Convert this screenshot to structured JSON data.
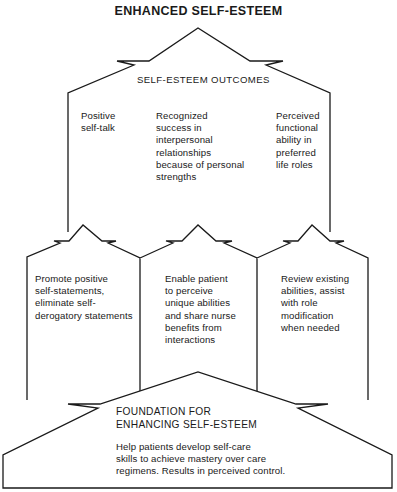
{
  "title": "ENHANCED SELF-ESTEEM",
  "outcomes": {
    "heading": "SELF-ESTEEM OUTCOMES",
    "items": [
      {
        "lines": [
          "Positive",
          "self-talk"
        ]
      },
      {
        "lines": [
          "Recognized",
          "success in",
          "interpersonal",
          "relationships",
          "because of personal",
          "strengths"
        ]
      },
      {
        "lines": [
          "Perceived",
          "functional",
          "ability in",
          "preferred",
          "life roles"
        ]
      }
    ]
  },
  "interventions": [
    {
      "lines": [
        "Promote positive",
        "self-statements,",
        "eliminate self-",
        "derogatory statements"
      ]
    },
    {
      "lines": [
        "Enable patient",
        "to perceive",
        "unique abilities",
        "and share nurse",
        "benefits from",
        "interactions"
      ]
    },
    {
      "lines": [
        "Review existing",
        "abilities, assist",
        "with role",
        "modification",
        "when needed"
      ]
    }
  ],
  "foundation": {
    "heading_lines": [
      "FOUNDATION FOR",
      "ENHANCING SELF-ESTEEM"
    ],
    "body_lines": [
      "Help patients develop self-care",
      "skills to achieve mastery over care",
      "regimens. Results in perceived control."
    ]
  },
  "colors": {
    "stroke": "#1a1a1a",
    "background": "#ffffff"
  }
}
